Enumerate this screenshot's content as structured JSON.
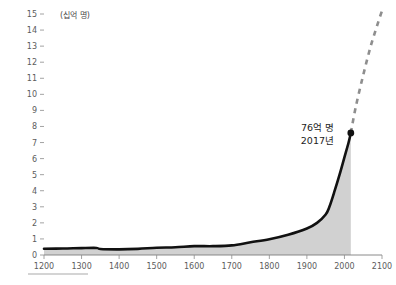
{
  "chart_data": {
    "type": "area",
    "title": "",
    "subtitle": "",
    "unit_label": "(십억 명)",
    "xlabel": "",
    "ylabel": "",
    "xlim": [
      1200,
      2100
    ],
    "ylim": [
      0,
      15
    ],
    "grid": false,
    "legend_position": "none",
    "x_ticks": [
      1200,
      1300,
      1400,
      1500,
      1600,
      1700,
      1800,
      1900,
      2000,
      2100
    ],
    "x_tick_labels": [
      "1200",
      "1300",
      "1400",
      "1500",
      "1600",
      "1700",
      "1800",
      "1900",
      "2000",
      "2100"
    ],
    "y_ticks": [
      0,
      1,
      2,
      3,
      4,
      5,
      6,
      7,
      8,
      9,
      10,
      11,
      12,
      13,
      14,
      15
    ],
    "y_tick_labels": [
      "0",
      "1",
      "2",
      "3",
      "4",
      "5",
      "6",
      "7",
      "8",
      "9",
      "10",
      "11",
      "12",
      "13",
      "14",
      "15"
    ],
    "series": [
      {
        "name": "historical-population",
        "style": "solid-line-with-area-fill",
        "color": "#111111",
        "fill_color": "#c9c9c9",
        "x": [
          1200,
          1250,
          1300,
          1340,
          1350,
          1400,
          1450,
          1500,
          1550,
          1600,
          1650,
          1700,
          1750,
          1800,
          1850,
          1900,
          1927,
          1950,
          1960,
          1974,
          1987,
          1999,
          2011,
          2017
        ],
        "values": [
          0.39,
          0.4,
          0.43,
          0.44,
          0.37,
          0.35,
          0.38,
          0.45,
          0.48,
          0.55,
          0.55,
          0.6,
          0.79,
          0.98,
          1.26,
          1.65,
          2.0,
          2.52,
          3.0,
          4.0,
          5.0,
          6.0,
          7.0,
          7.6
        ]
      },
      {
        "name": "projected-population",
        "style": "dashed-line",
        "color": "#8e8e8e",
        "x": [
          2017,
          2030,
          2050,
          2070,
          2090,
          2100
        ],
        "values": [
          7.6,
          9.2,
          11.2,
          13.0,
          14.5,
          15.2
        ]
      }
    ],
    "annotations": [
      {
        "name": "peak-2017",
        "line1": "76억 명",
        "line2": "2017년",
        "x": 2017,
        "y": 7.6,
        "marker": "dot"
      }
    ]
  }
}
